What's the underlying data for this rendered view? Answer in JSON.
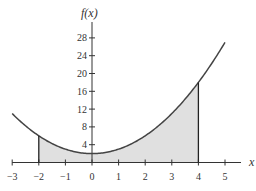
{
  "chart_data": {
    "type": "area",
    "title": "",
    "xlabel": "x",
    "ylabel": "f(x)",
    "function": "f(x) = x^2 + 2",
    "curve_domain": [
      -3,
      5
    ],
    "shaded_interval": [
      -2,
      4
    ],
    "xlim": [
      -3,
      5
    ],
    "ylim": [
      0,
      28
    ],
    "x_ticks": [
      -3,
      -2,
      -1,
      0,
      1,
      2,
      3,
      4,
      5
    ],
    "y_ticks": [
      4,
      8,
      12,
      16,
      20,
      24,
      28
    ],
    "points": [
      {
        "x": -3,
        "y": 11
      },
      {
        "x": -2,
        "y": 6
      },
      {
        "x": -1,
        "y": 3
      },
      {
        "x": 0,
        "y": 2
      },
      {
        "x": 1,
        "y": 3
      },
      {
        "x": 2,
        "y": 6
      },
      {
        "x": 3,
        "y": 11
      },
      {
        "x": 4,
        "y": 18
      },
      {
        "x": 5,
        "y": 27
      }
    ],
    "grid": false,
    "legend": null
  },
  "colors": {
    "curve": "#444444",
    "fill": "#e0e0e0",
    "axis": "#333333",
    "bound_lines": "#222222"
  },
  "labels": {
    "x_axis_title": "x",
    "y_axis_title": "f(x)"
  }
}
